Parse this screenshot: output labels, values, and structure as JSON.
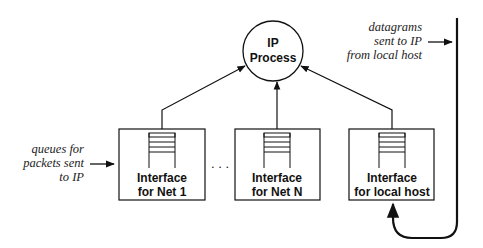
{
  "diagram": {
    "ip_process": {
      "line1": "IP",
      "line2": "Process"
    },
    "interfaces": [
      {
        "line1": "Interface",
        "line2": "for Net 1"
      },
      {
        "line1": "Interface",
        "line2": "for Net N"
      },
      {
        "line1": "Interface",
        "line2": "for local host"
      }
    ],
    "ellipsis": ". . .",
    "annotations": {
      "queues": [
        "queues for",
        "packets sent",
        "to IP"
      ],
      "datagrams": [
        "datagrams",
        "sent to IP",
        "from local host"
      ]
    },
    "colors": {
      "stroke": "#111111",
      "background": "#ffffff"
    }
  }
}
